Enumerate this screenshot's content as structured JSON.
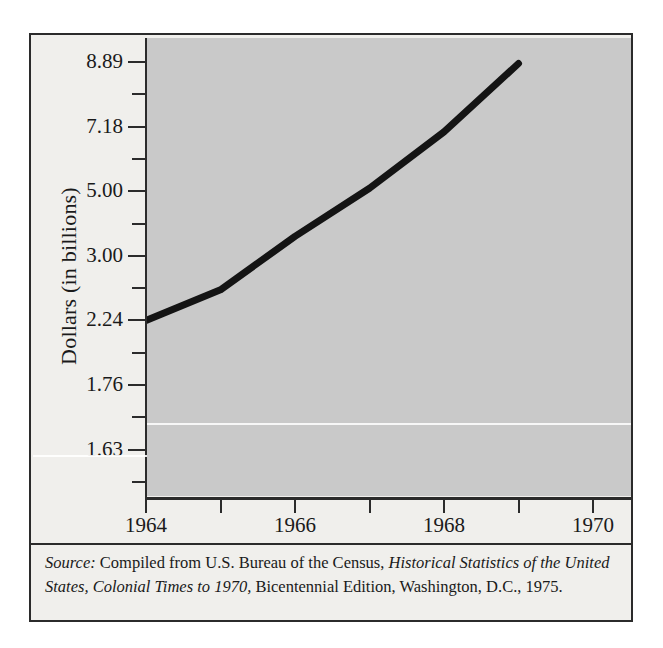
{
  "figure": {
    "y_axis_title": "Dollars (in billions)",
    "source_note": {
      "label": "Source:",
      "part1": " Compiled from U.S. Bureau of the Census, ",
      "italic1": "Historical Statistics of the United States, Colonial Times to 1970,",
      "part2": " Bicentennial Edition, Washington, D.C., 1975."
    },
    "colors": {
      "plot_background": "#c9c9c9",
      "page_background": "#f0efec",
      "line": "#141414",
      "axis": "#2b2b2b",
      "text": "#1a1a1a"
    }
  },
  "chart_data": {
    "type": "line",
    "title": "",
    "xlabel": "",
    "ylabel": "Dollars (in billions)",
    "grid": false,
    "legend": "none",
    "x": [
      1964,
      1965,
      1966,
      1967,
      1968,
      1969
    ],
    "values": [
      2.24,
      2.6,
      3.6,
      5.1,
      7.0,
      8.85
    ],
    "series": [
      {
        "name": "Dollars (in billions)",
        "values": [
          2.24,
          2.6,
          3.6,
          5.1,
          7.0,
          8.85
        ]
      }
    ],
    "x_ticks": [
      1964,
      1965,
      1966,
      1967,
      1968,
      1969,
      1970,
      1971
    ],
    "x_tick_labels": [
      "1964",
      "",
      "1966",
      "",
      "1968",
      "",
      "1970",
      ""
    ],
    "xlim": [
      1964,
      1971
    ],
    "y_tick_labels": [
      "8.89",
      "7.18",
      "5.00",
      "3.00",
      "2.24",
      "1.76",
      "1.63"
    ],
    "y_axis_note": "non-linear ordinal scale; labeled ticks evenly spaced with unlabeled minor ticks between",
    "ylim": [
      1.63,
      8.89
    ]
  }
}
